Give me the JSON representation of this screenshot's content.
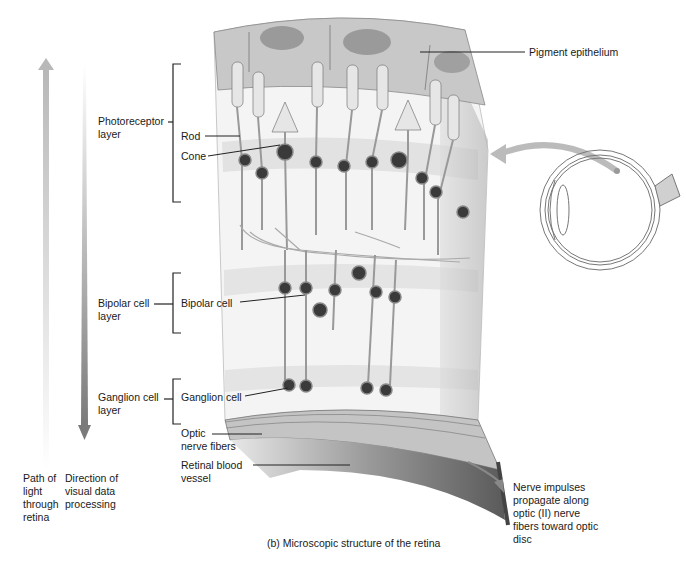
{
  "figure": {
    "caption": "(b) Microscopic structure of the retina"
  },
  "left_axis": {
    "light_path": {
      "label_lines": [
        "Path of",
        "light",
        "through",
        "retina"
      ],
      "direction": "up"
    },
    "data_processing": {
      "label_lines": [
        "Direction of",
        "visual data",
        "processing"
      ],
      "direction": "down"
    }
  },
  "layers": {
    "photoreceptor": {
      "label_lines": [
        "Photoreceptor",
        "layer"
      ]
    },
    "bipolar": {
      "label_lines": [
        "Bipolar cell",
        "layer"
      ]
    },
    "ganglion": {
      "label_lines": [
        "Ganglion cell",
        "layer"
      ]
    }
  },
  "callouts": {
    "rod": "Rod",
    "cone": "Cone",
    "bipolar_cell": "Bipolar cell",
    "ganglion_cell": "Ganglion cell",
    "optic_nerve_fibers": [
      "Optic",
      "nerve fibers"
    ],
    "retinal_blood_vessel": [
      "Retinal blood",
      "vessel"
    ],
    "pigment_epithelium": "Pigment epithelium",
    "nerve_impulses": [
      "Nerve impulses",
      "propagate along",
      "optic (II) nerve",
      "fibers toward optic",
      "disc"
    ]
  },
  "colors": {
    "tissue_light": "#ececec",
    "tissue_mid": "#d4d4d4",
    "tissue_dark": "#8a8a8a",
    "nucleus": "#3a3a3a",
    "arrow": "#9a9a9a"
  }
}
